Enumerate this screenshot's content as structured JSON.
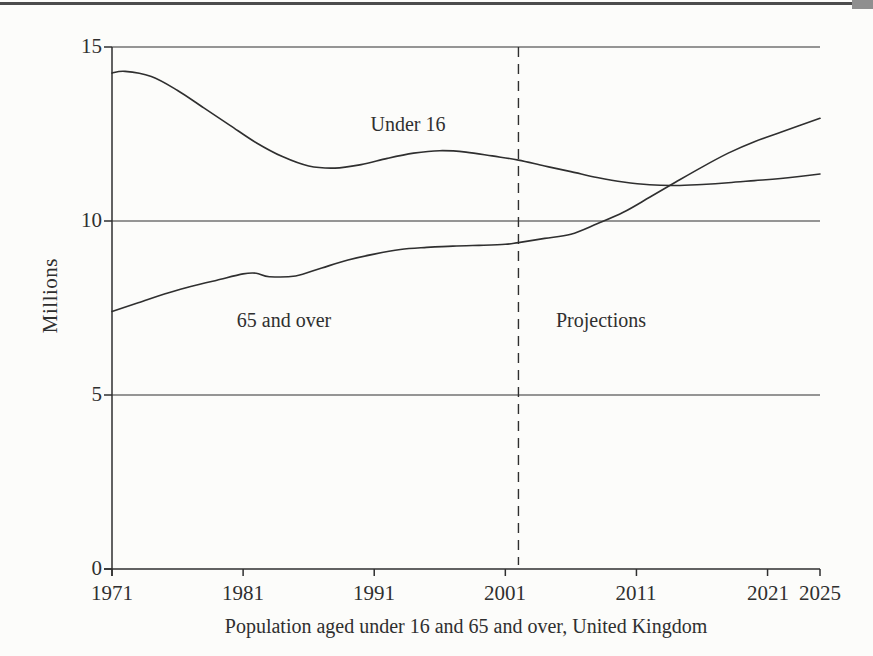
{
  "page": {
    "background_color": "#fcfcfa",
    "ink_color": "#2f2f2f",
    "top_rule_color": "#4c4c4c",
    "corner_block_color": "#8f8f8f"
  },
  "chart_data": {
    "type": "line",
    "caption": "Population aged under 16 and 65 and over, United Kingdom",
    "ylabel": "Millions",
    "xlabel": "",
    "xlim": [
      1971,
      2025
    ],
    "ylim": [
      0,
      15
    ],
    "x_ticks": [
      1971,
      1981,
      1991,
      2001,
      2011,
      2021,
      2025
    ],
    "y_ticks": [
      0,
      5,
      10,
      15
    ],
    "gridlines_at": [
      5,
      10,
      15
    ],
    "grid": "horizontal",
    "projection_divider_x": 2002,
    "annotations": {
      "under16": "Under 16",
      "over65": "65 and over",
      "projections": "Projections"
    },
    "legend_position": "inline-labels",
    "line_color": "#2f2f2f",
    "series": [
      {
        "name": "Under 16",
        "points": [
          [
            1971,
            14.25
          ],
          [
            1972,
            14.3
          ],
          [
            1974,
            14.15
          ],
          [
            1976,
            13.75
          ],
          [
            1978,
            13.25
          ],
          [
            1980,
            12.75
          ],
          [
            1982,
            12.25
          ],
          [
            1984,
            11.85
          ],
          [
            1986,
            11.58
          ],
          [
            1988,
            11.52
          ],
          [
            1990,
            11.62
          ],
          [
            1992,
            11.8
          ],
          [
            1994,
            11.95
          ],
          [
            1996,
            12.02
          ],
          [
            1998,
            11.98
          ],
          [
            2000,
            11.87
          ],
          [
            2002,
            11.75
          ],
          [
            2004,
            11.58
          ],
          [
            2006,
            11.42
          ],
          [
            2008,
            11.25
          ],
          [
            2010,
            11.12
          ],
          [
            2012,
            11.04
          ],
          [
            2014,
            11.02
          ],
          [
            2016,
            11.05
          ],
          [
            2018,
            11.1
          ],
          [
            2020,
            11.16
          ],
          [
            2022,
            11.22
          ],
          [
            2025,
            11.35
          ]
        ]
      },
      {
        "name": "65 and over",
        "points": [
          [
            1971,
            7.4
          ],
          [
            1973,
            7.65
          ],
          [
            1975,
            7.9
          ],
          [
            1977,
            8.12
          ],
          [
            1979,
            8.3
          ],
          [
            1981,
            8.48
          ],
          [
            1982,
            8.5
          ],
          [
            1983,
            8.4
          ],
          [
            1985,
            8.42
          ],
          [
            1987,
            8.65
          ],
          [
            1989,
            8.88
          ],
          [
            1991,
            9.05
          ],
          [
            1993,
            9.18
          ],
          [
            1995,
            9.24
          ],
          [
            1997,
            9.28
          ],
          [
            1999,
            9.3
          ],
          [
            2001,
            9.33
          ],
          [
            2002,
            9.38
          ],
          [
            2004,
            9.5
          ],
          [
            2006,
            9.62
          ],
          [
            2008,
            9.92
          ],
          [
            2010,
            10.25
          ],
          [
            2012,
            10.68
          ],
          [
            2014,
            11.12
          ],
          [
            2016,
            11.55
          ],
          [
            2018,
            11.95
          ],
          [
            2020,
            12.28
          ],
          [
            2022,
            12.55
          ],
          [
            2025,
            12.95
          ]
        ]
      }
    ]
  }
}
